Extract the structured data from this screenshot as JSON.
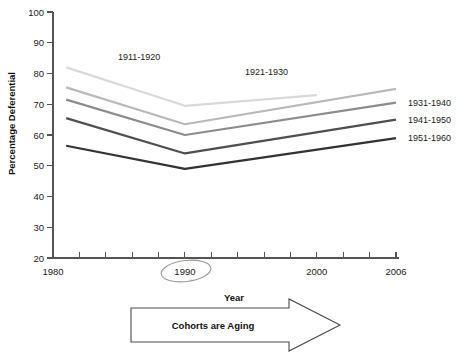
{
  "chart_data": {
    "type": "line",
    "title": "",
    "xlabel": "Year",
    "ylabel": "Percentage Deferential",
    "xlim": [
      1980,
      2006
    ],
    "ylim": [
      20,
      100
    ],
    "ytick_values": [
      20,
      30,
      40,
      50,
      60,
      70,
      80,
      90,
      100
    ],
    "ytick_labels": [
      "20",
      "30",
      "40",
      "50",
      "60",
      "70",
      "80",
      "90",
      "100"
    ],
    "xtick_values": [
      1980,
      1990,
      2000,
      2006
    ],
    "xtick_labels": [
      "1980",
      "1990",
      "2000",
      "2006"
    ],
    "xminor_values": [
      1982,
      1984,
      1986,
      1988,
      1992,
      1994,
      1996,
      1998,
      2002,
      2004
    ],
    "grid": false,
    "legend_position": "inline-right-and-inplot",
    "series": [
      {
        "name": "1911-1920",
        "color": "#d9d9d9",
        "label_placement": "in-plot",
        "x": [
          1981,
          1990,
          2000
        ],
        "values": [
          82.0,
          69.5,
          73.0
        ]
      },
      {
        "name": "1921-1930",
        "color": "#b9b9b9",
        "label_placement": "in-plot",
        "x": [
          1981,
          1990,
          2006
        ],
        "values": [
          75.5,
          63.5,
          75.0
        ]
      },
      {
        "name": "1931-1940",
        "color": "#8c8c8c",
        "label_placement": "right",
        "x": [
          1981,
          1990,
          2006
        ],
        "values": [
          71.5,
          60.0,
          70.5
        ]
      },
      {
        "name": "1941-1950",
        "color": "#4f4f4f",
        "label_placement": "right",
        "x": [
          1981,
          1990,
          2006
        ],
        "values": [
          65.5,
          54.0,
          65.0
        ]
      },
      {
        "name": "1951-1960",
        "color": "#333333",
        "label_placement": "right",
        "x": [
          1981,
          1990,
          2006
        ],
        "values": [
          56.5,
          49.0,
          59.0
        ]
      }
    ],
    "annotations": [
      {
        "name": "circle-1990",
        "type": "ellipse",
        "target": "1990",
        "note": "hand-drawn ellipse circling the 1990 tick label"
      },
      {
        "name": "aging-arrow",
        "type": "arrow-banner",
        "text": "Cohorts are Aging",
        "direction": "right"
      }
    ]
  },
  "axis": {
    "ylabel": "Percentage Deferential",
    "xlabel": "Year"
  },
  "banner": {
    "text": "Cohorts are Aging"
  }
}
